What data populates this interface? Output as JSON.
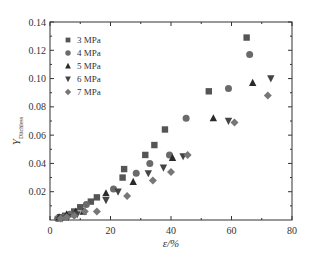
{
  "chart_data": {
    "type": "scatter",
    "title": "",
    "xlabel": "ε/%",
    "ylabel": "Y_Ditchless",
    "ylabel_main": "Y",
    "ylabel_sub": "Ditchless",
    "xlim": [
      0,
      80
    ],
    "ylim": [
      0,
      0.14
    ],
    "xticks": [
      0,
      20,
      40,
      60,
      80
    ],
    "yticks": [
      0.02,
      0.04,
      0.06,
      0.08,
      0.1,
      0.12,
      0.14
    ],
    "ytick_labels": [
      "0.02",
      "0.04",
      "0.06",
      "0.08",
      "0.10",
      "0.12",
      "0.14"
    ],
    "grid": false,
    "legend_position": "upper left",
    "series": [
      {
        "name": "3 MPa",
        "marker": "square",
        "color": "#555555",
        "x": [
          3.3,
          5.0,
          8.0,
          10.0,
          13.5,
          15.5,
          24.5,
          24.0,
          31.5,
          34.5,
          38.0,
          52.5,
          65.0
        ],
        "y": [
          0.002,
          0.003,
          0.006,
          0.009,
          0.013,
          0.016,
          0.036,
          0.03,
          0.046,
          0.053,
          0.064,
          0.091,
          0.129
        ]
      },
      {
        "name": "4 MPa",
        "marker": "circle",
        "color": "#6a6a6a",
        "x": [
          2.5,
          4.5,
          6.5,
          12.0,
          21.0,
          28.5,
          33.0,
          39.5,
          45.0,
          59.0,
          66.0
        ],
        "y": [
          0.001,
          0.002,
          0.004,
          0.011,
          0.022,
          0.033,
          0.04,
          0.046,
          0.072,
          0.093,
          0.117
        ]
      },
      {
        "name": "5 MPa",
        "marker": "triangle-up",
        "color": "#2a2a2a",
        "x": [
          3.0,
          5.5,
          8.5,
          11.0,
          18.5,
          27.5,
          40.5,
          54.0,
          67.0
        ],
        "y": [
          0.002,
          0.004,
          0.006,
          0.006,
          0.019,
          0.027,
          0.044,
          0.072,
          0.097
        ]
      },
      {
        "name": "6 MPa",
        "marker": "triangle-down",
        "color": "#444444",
        "x": [
          4.0,
          6.0,
          9.0,
          18.5,
          22.5,
          32.5,
          37.5,
          44.0,
          59.0,
          73.0
        ],
        "y": [
          0.001,
          0.002,
          0.004,
          0.014,
          0.02,
          0.033,
          0.037,
          0.045,
          0.07,
          0.1
        ]
      },
      {
        "name": "7 MPa",
        "marker": "diamond",
        "color": "#777777",
        "x": [
          3.5,
          5.5,
          8.0,
          11.5,
          15.5,
          25.5,
          34.0,
          40.0,
          45.5,
          61.0,
          72.0
        ],
        "y": [
          0.001,
          0.002,
          0.003,
          0.006,
          0.006,
          0.017,
          0.028,
          0.034,
          0.046,
          0.069,
          0.088
        ]
      }
    ]
  },
  "colors": {
    "axis": "#333333",
    "background": "#ffffff"
  }
}
